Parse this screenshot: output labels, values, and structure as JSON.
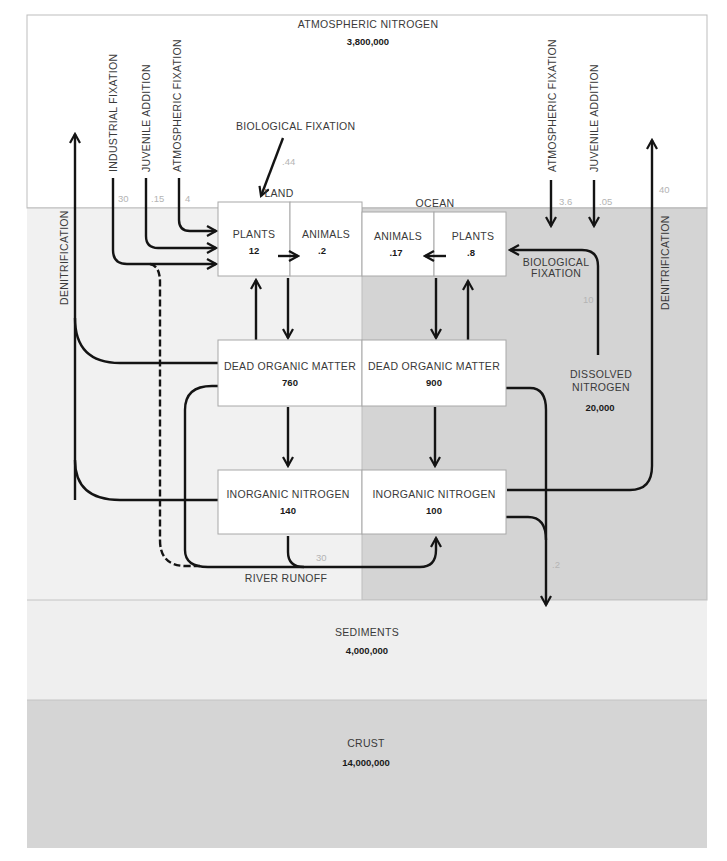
{
  "diagram": {
    "colors": {
      "atmosphere": "#ffffff",
      "land": "#f1f1f1",
      "ocean": "#d4d4d4",
      "sediments": "#efefef",
      "crust": "#d5d5d5",
      "arrow": "#141414",
      "flux_text": "#b4b4b4"
    },
    "reservoirs": {
      "atmosphere": {
        "label": "ATMOSPHERIC NITROGEN",
        "value": "3,800,000"
      },
      "land_region_label": "LAND",
      "ocean_region_label": "OCEAN",
      "land_plants": {
        "label": "PLANTS",
        "value": "12"
      },
      "land_animals": {
        "label": "ANIMALS",
        "value": ".2"
      },
      "ocean_animals": {
        "label": "ANIMALS",
        "value": ".17"
      },
      "ocean_plants": {
        "label": "PLANTS",
        "value": ".8"
      },
      "land_dead_organic": {
        "label": "DEAD ORGANIC MATTER",
        "value": "760"
      },
      "ocean_dead_organic": {
        "label": "DEAD ORGANIC MATTER",
        "value": "900"
      },
      "land_inorganic": {
        "label": "INORGANIC NITROGEN",
        "value": "140"
      },
      "ocean_inorganic": {
        "label": "INORGANIC NITROGEN",
        "value": "100"
      },
      "dissolved_nitrogen": {
        "label_line1": "DISSOLVED",
        "label_line2": "NITROGEN",
        "value": "20,000"
      },
      "sediments": {
        "label": "SEDIMENTS",
        "value": "4,000,000"
      },
      "crust": {
        "label": "CRUST",
        "value": "14,000,000"
      }
    },
    "fluxes": {
      "land_industrial_fixation": {
        "label": "INDUSTRIAL FIXATION",
        "value": "30"
      },
      "land_juvenile_addition": {
        "label": "JUVENILE ADDITION",
        "value": ".15"
      },
      "land_atmospheric_fixation": {
        "label": "ATMOSPHERIC FIXATION",
        "value": "4"
      },
      "land_biological_fixation": {
        "label": "BIOLOGICAL FIXATION",
        "value": ".44"
      },
      "land_denitrification": {
        "label": "DENITRIFICATION"
      },
      "ocean_atmospheric_fixation": {
        "label": "ATMOSPHERIC FIXATION",
        "value": "3.6"
      },
      "ocean_juvenile_addition": {
        "label": "JUVENILE ADDITION",
        "value": ".05"
      },
      "ocean_biological_fixation": {
        "label_line1": "BIOLOGICAL",
        "label_line2": "FIXATION",
        "value": "10"
      },
      "ocean_denitrification": {
        "label": "DENITRIFICATION",
        "value": "40"
      },
      "river_runoff": {
        "label": "RIVER RUNOFF",
        "value": "30"
      },
      "ocean_to_sediments": {
        "value": ".2"
      }
    }
  }
}
